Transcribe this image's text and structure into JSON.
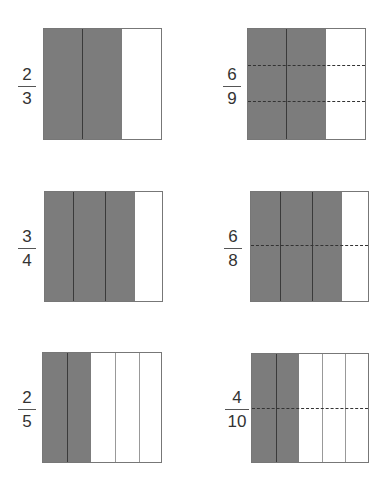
{
  "colors": {
    "shaded": "#7c7c7c",
    "outline": "#777777",
    "divider": "#3a3a3a",
    "background": "#ffffff"
  },
  "models": [
    {
      "id": "m1",
      "numerator": "2",
      "denominator": "3",
      "columns": 3,
      "shaded_columns": 2,
      "horizontal_cuts": 0
    },
    {
      "id": "m2",
      "numerator": "6",
      "denominator": "9",
      "columns": 3,
      "shaded_columns": 2,
      "horizontal_cuts": 2
    },
    {
      "id": "m3",
      "numerator": "3",
      "denominator": "4",
      "columns": 4,
      "shaded_columns": 3,
      "horizontal_cuts": 0
    },
    {
      "id": "m4",
      "numerator": "6",
      "denominator": "8",
      "columns": 4,
      "shaded_columns": 3,
      "horizontal_cuts": 1
    },
    {
      "id": "m5",
      "numerator": "2",
      "denominator": "5",
      "columns": 5,
      "shaded_columns": 2,
      "horizontal_cuts": 0
    },
    {
      "id": "m6",
      "numerator": "4",
      "denominator": "10",
      "columns": 5,
      "shaded_columns": 2,
      "horizontal_cuts": 1
    }
  ]
}
